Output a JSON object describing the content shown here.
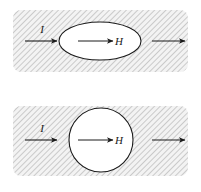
{
  "figure": {
    "caption": "",
    "background_color": "#ffffff",
    "hatch_color": "#9a9a9a",
    "hatch_fill_color": "#f2f2f2",
    "outline_color": "#1a1a1a",
    "body_fill_color": "#ffffff",
    "panels": [
      {
        "name": "top-panel",
        "shape": "ellipse",
        "shape_label": "H",
        "left_arrow_label": "I",
        "right_arrow_label": "",
        "hatched_region": {
          "x": 13,
          "y": 10,
          "width": 175,
          "height": 62,
          "corner_radius": 8
        },
        "body": {
          "cx": 100,
          "cy": 41,
          "rx": 41,
          "ry": 19
        },
        "arrows": [
          {
            "name": "current-arrow-left",
            "x1": 25,
            "y1": 41,
            "x2": 57,
            "y2": 41,
            "label": "I"
          },
          {
            "name": "field-arrow-center",
            "x1": 78,
            "y1": 41,
            "x2": 113,
            "y2": 41,
            "label": "H"
          },
          {
            "name": "current-arrow-right",
            "x1": 152,
            "y1": 41,
            "x2": 185,
            "y2": 41,
            "label": ""
          }
        ]
      },
      {
        "name": "bottom-panel",
        "shape": "circle",
        "shape_label": "H",
        "left_arrow_label": "I",
        "right_arrow_label": "",
        "hatched_region": {
          "x": 13,
          "y": 10,
          "width": 175,
          "height": 70,
          "corner_radius": 8
        },
        "body": {
          "cx": 101,
          "cy": 44,
          "rx": 32,
          "ry": 32
        },
        "arrows": [
          {
            "name": "current-arrow-left",
            "x1": 25,
            "y1": 44,
            "x2": 57,
            "y2": 44,
            "label": "I"
          },
          {
            "name": "field-arrow-center",
            "x1": 78,
            "y1": 44,
            "x2": 113,
            "y2": 44,
            "label": "H"
          },
          {
            "name": "current-arrow-right",
            "x1": 152,
            "y1": 44,
            "x2": 185,
            "y2": 44,
            "label": ""
          }
        ]
      }
    ]
  }
}
